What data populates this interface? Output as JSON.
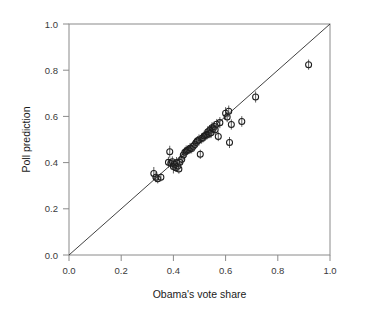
{
  "chart_data": {
    "type": "scatter",
    "title": "",
    "xlabel": "Obama's vote share",
    "ylabel": "Poll prediction",
    "xlim": [
      0.0,
      1.0
    ],
    "ylim": [
      0.0,
      1.0
    ],
    "grid": false,
    "legend": null,
    "annotations": [
      {
        "text": "identity line y = x",
        "type": "reference-line",
        "from": [
          0.0,
          0.0
        ],
        "to": [
          1.0,
          1.0
        ]
      }
    ],
    "xticks": [
      0.0,
      0.2,
      0.4,
      0.6,
      0.8,
      1.0
    ],
    "yticks": [
      0.0,
      0.2,
      0.4,
      0.6,
      0.8,
      1.0
    ],
    "xtick_labels": [
      "0.0",
      "0.2",
      "0.4",
      "0.6",
      "0.8",
      "1.0"
    ],
    "ytick_labels": [
      "0.0",
      "0.2",
      "0.4",
      "0.6",
      "0.8",
      "1.0"
    ],
    "marker_style": "open-circle",
    "error_bars": "vertical",
    "points": [
      {
        "x": 0.325,
        "y": 0.353,
        "yerr": 0.028
      },
      {
        "x": 0.333,
        "y": 0.337,
        "yerr": 0.022
      },
      {
        "x": 0.34,
        "y": 0.33,
        "yerr": 0.02
      },
      {
        "x": 0.352,
        "y": 0.337,
        "yerr": 0.018
      },
      {
        "x": 0.381,
        "y": 0.401,
        "yerr": 0.024
      },
      {
        "x": 0.386,
        "y": 0.447,
        "yerr": 0.026
      },
      {
        "x": 0.39,
        "y": 0.397,
        "yerr": 0.02
      },
      {
        "x": 0.396,
        "y": 0.404,
        "yerr": 0.023
      },
      {
        "x": 0.4,
        "y": 0.383,
        "yerr": 0.03
      },
      {
        "x": 0.404,
        "y": 0.393,
        "yerr": 0.021
      },
      {
        "x": 0.409,
        "y": 0.378,
        "yerr": 0.018
      },
      {
        "x": 0.412,
        "y": 0.4,
        "yerr": 0.024
      },
      {
        "x": 0.417,
        "y": 0.385,
        "yerr": 0.019
      },
      {
        "x": 0.421,
        "y": 0.372,
        "yerr": 0.02
      },
      {
        "x": 0.425,
        "y": 0.402,
        "yerr": 0.022
      },
      {
        "x": 0.432,
        "y": 0.414,
        "yerr": 0.023
      },
      {
        "x": 0.438,
        "y": 0.433,
        "yerr": 0.021
      },
      {
        "x": 0.444,
        "y": 0.445,
        "yerr": 0.022
      },
      {
        "x": 0.449,
        "y": 0.449,
        "yerr": 0.025
      },
      {
        "x": 0.454,
        "y": 0.453,
        "yerr": 0.02
      },
      {
        "x": 0.459,
        "y": 0.456,
        "yerr": 0.019
      },
      {
        "x": 0.464,
        "y": 0.462,
        "yerr": 0.023
      },
      {
        "x": 0.47,
        "y": 0.461,
        "yerr": 0.021
      },
      {
        "x": 0.476,
        "y": 0.471,
        "yerr": 0.02
      },
      {
        "x": 0.482,
        "y": 0.478,
        "yerr": 0.022
      },
      {
        "x": 0.487,
        "y": 0.487,
        "yerr": 0.019
      },
      {
        "x": 0.492,
        "y": 0.494,
        "yerr": 0.021
      },
      {
        "x": 0.498,
        "y": 0.498,
        "yerr": 0.024
      },
      {
        "x": 0.503,
        "y": 0.436,
        "yerr": 0.02
      },
      {
        "x": 0.508,
        "y": 0.504,
        "yerr": 0.022
      },
      {
        "x": 0.513,
        "y": 0.508,
        "yerr": 0.021
      },
      {
        "x": 0.518,
        "y": 0.515,
        "yerr": 0.023
      },
      {
        "x": 0.523,
        "y": 0.517,
        "yerr": 0.02
      },
      {
        "x": 0.528,
        "y": 0.521,
        "yerr": 0.022
      },
      {
        "x": 0.532,
        "y": 0.533,
        "yerr": 0.025
      },
      {
        "x": 0.536,
        "y": 0.524,
        "yerr": 0.019
      },
      {
        "x": 0.54,
        "y": 0.541,
        "yerr": 0.021
      },
      {
        "x": 0.544,
        "y": 0.529,
        "yerr": 0.023
      },
      {
        "x": 0.548,
        "y": 0.551,
        "yerr": 0.024
      },
      {
        "x": 0.552,
        "y": 0.546,
        "yerr": 0.02
      },
      {
        "x": 0.556,
        "y": 0.556,
        "yerr": 0.022
      },
      {
        "x": 0.56,
        "y": 0.542,
        "yerr": 0.021
      },
      {
        "x": 0.566,
        "y": 0.566,
        "yerr": 0.023
      },
      {
        "x": 0.572,
        "y": 0.513,
        "yerr": 0.02
      },
      {
        "x": 0.578,
        "y": 0.573,
        "yerr": 0.024
      },
      {
        "x": 0.6,
        "y": 0.614,
        "yerr": 0.026
      },
      {
        "x": 0.606,
        "y": 0.597,
        "yerr": 0.022
      },
      {
        "x": 0.612,
        "y": 0.622,
        "yerr": 0.025
      },
      {
        "x": 0.615,
        "y": 0.487,
        "yerr": 0.024
      },
      {
        "x": 0.622,
        "y": 0.565,
        "yerr": 0.022
      },
      {
        "x": 0.662,
        "y": 0.578,
        "yerr": 0.023
      },
      {
        "x": 0.715,
        "y": 0.684,
        "yerr": 0.024
      },
      {
        "x": 0.918,
        "y": 0.824,
        "yerr": 0.022
      }
    ]
  }
}
